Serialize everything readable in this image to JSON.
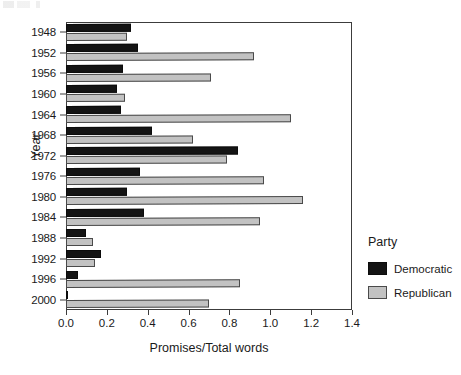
{
  "chart_data": {
    "type": "bar",
    "orientation": "horizontal",
    "title": "",
    "xlabel": "Promises/Total words",
    "ylabel": "Year",
    "xlim": [
      0.0,
      1.4
    ],
    "xticks": [
      "0.0",
      "0.2",
      "0.4",
      "0.6",
      "0.8",
      "1.0",
      "1.2",
      "1.4"
    ],
    "xtick_values": [
      0.0,
      0.2,
      0.4,
      0.6,
      0.8,
      1.0,
      1.2,
      1.4
    ],
    "grid": false,
    "legend_position": "right-outside",
    "categories": [
      "1948",
      "1952",
      "1956",
      "1960",
      "1964",
      "1968",
      "1972",
      "1976",
      "1980",
      "1984",
      "1988",
      "1992",
      "1996",
      "2000"
    ],
    "series": [
      {
        "name": "Democratic",
        "color": "#141414",
        "values": [
          0.32,
          0.35,
          0.28,
          0.25,
          0.27,
          0.42,
          0.84,
          0.36,
          0.3,
          0.38,
          0.1,
          0.17,
          0.06,
          0.01
        ]
      },
      {
        "name": "Republican",
        "color": "#c2c2c2",
        "values": [
          0.3,
          0.92,
          0.71,
          0.29,
          1.1,
          0.62,
          0.79,
          0.97,
          1.16,
          0.95,
          0.13,
          0.14,
          0.85,
          0.7
        ]
      }
    ]
  },
  "legend": {
    "title": "Party",
    "entries": [
      {
        "label": "Democratic"
      },
      {
        "label": "Republican"
      }
    ]
  }
}
